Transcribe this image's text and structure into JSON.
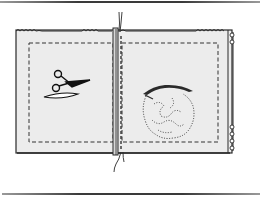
{
  "figure": {
    "colors": {
      "background": "#ffffff",
      "fabric_fill": "#ececec",
      "outline": "#2a2a2a",
      "rule": "#444444"
    },
    "elements": {
      "top_rule": "top-rule",
      "bottom_rule": "bottom-rule",
      "fabric": "fabric-panel",
      "left_stitch": "left-stitch-line",
      "right_stitch": "right-stitch-line",
      "center_seam": "center-seam",
      "thread": "thread",
      "scissors": "scissors-icon",
      "stuffing": "stuffing-icon"
    }
  }
}
